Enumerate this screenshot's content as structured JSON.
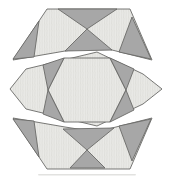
{
  "figure": {
    "title_hint": "hexagon-dissection-diagram",
    "width": 173,
    "height": 179,
    "colors": {
      "background": "#ffffff",
      "light_fill": "#e9e9e6",
      "hatch_line": "#d9d9d4",
      "dark_fill": "#a7a7a7",
      "outline": "#6a6a68",
      "artifact": "#d8d8d5"
    },
    "stroke_width": 0.9,
    "pieces": [
      {
        "name": "top-cap",
        "tone": "light",
        "points": [
          [
            47,
            9
          ],
          [
            130,
            9
          ],
          [
            152,
            60
          ],
          [
            112,
            50
          ],
          [
            97,
            46
          ],
          [
            65,
            51
          ],
          [
            13,
            60
          ]
        ]
      },
      {
        "name": "middle-band",
        "tone": "light",
        "points": [
          [
            10,
            89
          ],
          [
            26,
            69
          ],
          [
            97,
            52
          ],
          [
            143,
            74
          ],
          [
            162,
            89
          ],
          [
            143,
            104
          ],
          [
            97,
            126
          ],
          [
            26,
            109
          ]
        ]
      },
      {
        "name": "bottom-cap",
        "tone": "light",
        "points": [
          [
            13,
            118
          ],
          [
            65,
            127
          ],
          [
            97,
            132
          ],
          [
            112,
            128
          ],
          [
            152,
            118
          ],
          [
            130,
            169
          ],
          [
            47,
            169
          ]
        ]
      },
      {
        "name": "middle-inner-hexagon",
        "tone": "light",
        "points": [
          [
            64,
            58
          ],
          [
            110,
            58
          ],
          [
            126,
            90
          ],
          [
            110,
            122
          ],
          [
            64,
            122
          ],
          [
            48,
            90
          ]
        ]
      },
      {
        "name": "top-x-upper-triangle",
        "tone": "dark",
        "points": [
          [
            58,
            9
          ],
          [
            117,
            9
          ],
          [
            87,
            29
          ]
        ]
      },
      {
        "name": "top-x-lower-triangle",
        "tone": "dark",
        "points": [
          [
            87,
            29
          ],
          [
            65,
            51
          ],
          [
            112,
            50
          ]
        ]
      },
      {
        "name": "top-left-corner-triangle",
        "tone": "dark",
        "points": [
          [
            39,
            21
          ],
          [
            13,
            59
          ],
          [
            34,
            57
          ]
        ]
      },
      {
        "name": "top-right-corner-triangle",
        "tone": "dark",
        "points": [
          [
            132,
            17
          ],
          [
            119,
            52
          ],
          [
            151,
            59
          ]
        ]
      },
      {
        "name": "mid-left-upper-triangle",
        "tone": "dark",
        "points": [
          [
            64,
            58
          ],
          [
            43,
            65
          ],
          [
            48,
            90
          ]
        ]
      },
      {
        "name": "mid-left-lower-triangle",
        "tone": "dark",
        "points": [
          [
            64,
            122
          ],
          [
            43,
            114
          ],
          [
            48,
            90
          ]
        ]
      },
      {
        "name": "mid-right-upper-triangle",
        "tone": "dark",
        "points": [
          [
            110,
            58
          ],
          [
            134,
            69
          ],
          [
            126,
            90
          ]
        ]
      },
      {
        "name": "mid-right-lower-triangle",
        "tone": "dark",
        "points": [
          [
            110,
            122
          ],
          [
            134,
            110
          ],
          [
            126,
            90
          ]
        ]
      },
      {
        "name": "bottom-x-upper-triangle",
        "tone": "dark",
        "points": [
          [
            87,
            150
          ],
          [
            63,
            129
          ],
          [
            114,
            128
          ]
        ]
      },
      {
        "name": "bottom-x-lower-triangle",
        "tone": "dark",
        "points": [
          [
            70,
            168
          ],
          [
            105,
            168
          ],
          [
            87,
            150
          ]
        ]
      },
      {
        "name": "bottom-left-corner-triangle",
        "tone": "dark",
        "points": [
          [
            39,
            157
          ],
          [
            13,
            119
          ],
          [
            34,
            121
          ]
        ]
      },
      {
        "name": "bottom-right-corner-triangle",
        "tone": "dark",
        "points": [
          [
            132,
            161
          ],
          [
            119,
            126
          ],
          [
            151,
            119
          ]
        ]
      }
    ],
    "scan_artifact": {
      "x": 38,
      "y": 174,
      "width": 98,
      "height": 1.6
    }
  }
}
